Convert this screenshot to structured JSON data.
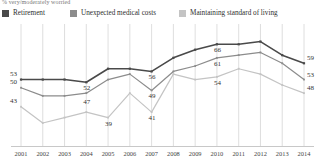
{
  "subtitle": "% very/moderately worried",
  "legend": {
    "position": "top-left",
    "items": [
      {
        "label": "Retirement",
        "color": "#4a4a4a",
        "swatch": "legend-swatch-retirement"
      },
      {
        "label": "Unexpected medical costs",
        "color": "#8c8c8c",
        "swatch": "legend-swatch-medical"
      },
      {
        "label": "Maintaining standard of living",
        "color": "#c4c4c4",
        "swatch": "legend-swatch-standard"
      }
    ]
  },
  "chart_data": {
    "type": "line",
    "title": "",
    "subtitle": "% very/moderately worried",
    "xlabel": "",
    "ylabel": "",
    "ylim": [
      30,
      72
    ],
    "grid": "vertical",
    "legend_position": "top-left",
    "categories": [
      "2001",
      "2002",
      "2003",
      "2004",
      "2005",
      "2006",
      "2007",
      "2008",
      "2009",
      "2010",
      "2011",
      "2012",
      "2013",
      "2014"
    ],
    "series": [
      {
        "name": "Retirement",
        "color": "#4a4a4a",
        "values": [
          53,
          53,
          53,
          52,
          57,
          57,
          56,
          61,
          64,
          66,
          66,
          67,
          62,
          59
        ],
        "point_labels": {
          "2001": "53",
          "2004": "52",
          "2007": "56",
          "2010": "66",
          "2014": "59"
        }
      },
      {
        "name": "Unexpected medical costs",
        "color": "#8c8c8c",
        "values": [
          50,
          47,
          47,
          48,
          53,
          55,
          49,
          56,
          58,
          61,
          62,
          63,
          59,
          53
        ],
        "point_labels": {
          "2001": "50",
          "2004": "47",
          "2007": "49",
          "2010": "61",
          "2014": "53"
        }
      },
      {
        "name": "Maintaining standard of living",
        "color": "#c4c4c4",
        "values": [
          43,
          37,
          39,
          41,
          39,
          48,
          41,
          55,
          53,
          54,
          57,
          55,
          51,
          48
        ],
        "point_labels": {
          "2001": "43",
          "2005": "39",
          "2007": "41",
          "2010": "54",
          "2014": "48"
        }
      }
    ],
    "value_labels": [
      {
        "text": "53",
        "series": "Retirement",
        "x": "2001",
        "y": 53
      },
      {
        "text": "50",
        "series": "Unexpected medical costs",
        "x": "2001",
        "y": 50
      },
      {
        "text": "43",
        "series": "Maintaining standard of living",
        "x": "2001",
        "y": 43
      },
      {
        "text": "52",
        "series": "Retirement",
        "x": "2004",
        "y": 52
      },
      {
        "text": "47",
        "series": "Unexpected medical costs",
        "x": "2004",
        "y": 47
      },
      {
        "text": "39",
        "series": "Maintaining standard of living",
        "x": "2005",
        "y": 39
      },
      {
        "text": "56",
        "series": "Retirement",
        "x": "2007",
        "y": 56
      },
      {
        "text": "49",
        "series": "Unexpected medical costs",
        "x": "2007",
        "y": 49
      },
      {
        "text": "41",
        "series": "Maintaining standard of living",
        "x": "2007",
        "y": 41
      },
      {
        "text": "66",
        "series": "Retirement",
        "x": "2010",
        "y": 66
      },
      {
        "text": "61",
        "series": "Unexpected medical costs",
        "x": "2010",
        "y": 61
      },
      {
        "text": "54",
        "series": "Maintaining standard of living",
        "x": "2010",
        "y": 54
      },
      {
        "text": "59",
        "series": "Retirement",
        "x": "2014",
        "y": 59
      },
      {
        "text": "53",
        "series": "Unexpected medical costs",
        "x": "2014",
        "y": 53
      },
      {
        "text": "48",
        "series": "Maintaining standard of living",
        "x": "2014",
        "y": 48
      }
    ]
  },
  "colors": {
    "retirement": "#4a4a4a",
    "medical": "#8c8c8c",
    "standard": "#c4c4c4",
    "gridline": "#d6d6d6",
    "axis": "#c8c8c8",
    "text": "#333333"
  }
}
